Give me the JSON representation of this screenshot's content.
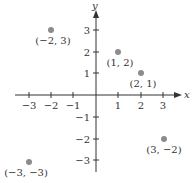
{
  "diagram": {
    "type": "coordinate-plane",
    "axes": {
      "x_label": "x",
      "y_label": "y",
      "range": [
        -3,
        3
      ]
    },
    "x_ticks": [
      {
        "value": -3,
        "label": "−3"
      },
      {
        "value": -2,
        "label": "−2"
      },
      {
        "value": -1,
        "label": "−1"
      },
      {
        "value": 1,
        "label": "1"
      },
      {
        "value": 2,
        "label": "2"
      },
      {
        "value": 3,
        "label": "3"
      }
    ],
    "y_ticks": [
      {
        "value": 3,
        "label": "3"
      },
      {
        "value": 2,
        "label": "2"
      },
      {
        "value": 1,
        "label": "1"
      },
      {
        "value": -1,
        "label": "−1"
      },
      {
        "value": -2,
        "label": "−2"
      },
      {
        "value": -3,
        "label": "−3"
      }
    ],
    "points": [
      {
        "x": -2,
        "y": 3,
        "label": "(−2, 3)"
      },
      {
        "x": 1,
        "y": 2,
        "label": "(1, 2)"
      },
      {
        "x": 2,
        "y": 1,
        "label": "(2, 1)"
      },
      {
        "x": 3,
        "y": -2,
        "label": "(3, −2)"
      },
      {
        "x": -3,
        "y": -3,
        "label": "(−3, −3)"
      }
    ],
    "colors": {
      "axis": "#333333",
      "point": "#8c8c8c"
    }
  }
}
